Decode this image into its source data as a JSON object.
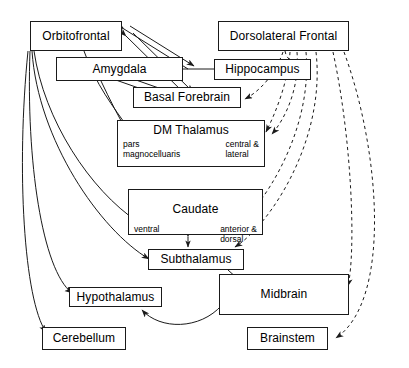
{
  "figure": {
    "kind": "neuroanatomical-circuit-diagram",
    "width": 409,
    "height": 368,
    "line_color": "#1a1a1a",
    "background": "#ffffff"
  },
  "nodes": {
    "orbitofrontal": {
      "label": "Orbitofrontal"
    },
    "dorsolateral_frontal": {
      "label": "Dorsolateral Frontal"
    },
    "amygdala": {
      "label": "Amygdala"
    },
    "hippocampus": {
      "label": "Hippocampus"
    },
    "basal_forebrain": {
      "label": "Basal Forebrain"
    },
    "dm_thalamus": {
      "label": "DM Thalamus",
      "sub_left": "pars\nmagnocelluaris",
      "sub_right": "central &\nlateral"
    },
    "caudate": {
      "label": "Caudate",
      "sub_left": "ventral",
      "sub_right": "anterior &\ndorsal"
    },
    "subthalamus": {
      "label": "Subthalamus"
    },
    "midbrain": {
      "label": "Midbrain"
    },
    "hypothalamus": {
      "label": "Hypothalamus"
    },
    "cerebellum": {
      "label": "Cerebellum"
    },
    "brainstem": {
      "label": "Brainstem"
    }
  },
  "edges": {
    "solid_style": "solid",
    "dashed_style": "dashed",
    "solid": [
      {
        "from": "orbitofrontal",
        "to": "amygdala",
        "heads": "both"
      },
      {
        "from": "orbitofrontal",
        "to": "basal_forebrain",
        "heads": "both"
      },
      {
        "from": "amygdala",
        "to": "basal_forebrain",
        "heads": "both"
      },
      {
        "from": "amygdala",
        "to": "hippocampus",
        "heads": "none"
      },
      {
        "from": "orbitofrontal",
        "to": "dm_thalamus",
        "heads": "end"
      },
      {
        "from": "amygdala",
        "to": "dm_thalamus",
        "heads": "end"
      },
      {
        "from": "orbitofrontal",
        "to": "caudate",
        "heads": "end"
      },
      {
        "from": "orbitofrontal",
        "to": "subthalamus",
        "heads": "end"
      },
      {
        "from": "orbitofrontal",
        "to": "hypothalamus",
        "heads": "end"
      },
      {
        "from": "orbitofrontal",
        "to": "cerebellum",
        "heads": "end"
      },
      {
        "from": "caudate",
        "to": "subthalamus",
        "heads": "both"
      },
      {
        "from": "subthalamus",
        "to": "midbrain",
        "heads": "end"
      },
      {
        "from": "midbrain",
        "to": "hypothalamus",
        "heads": "end"
      }
    ],
    "dashed": [
      {
        "from": "dorsolateral_frontal",
        "to": "hippocampus",
        "heads": "end"
      },
      {
        "from": "dorsolateral_frontal",
        "to": "basal_forebrain",
        "heads": "end"
      },
      {
        "from": "dorsolateral_frontal",
        "to": "dm_thalamus",
        "heads": "end"
      },
      {
        "from": "dorsolateral_frontal",
        "to": "caudate",
        "heads": "end"
      },
      {
        "from": "dorsolateral_frontal",
        "to": "subthalamus",
        "heads": "end"
      },
      {
        "from": "dorsolateral_frontal",
        "to": "midbrain",
        "heads": "end"
      },
      {
        "from": "dorsolateral_frontal",
        "to": "brainstem",
        "heads": "end"
      }
    ]
  }
}
